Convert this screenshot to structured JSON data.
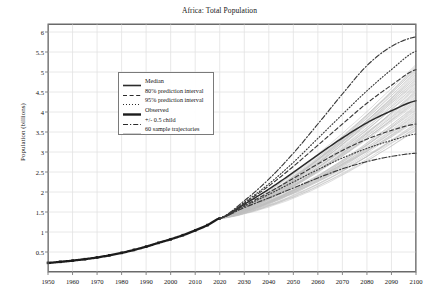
{
  "chart_data": {
    "type": "line",
    "title": "Africa: Total Population",
    "xlabel": "",
    "ylabel": "Population (billions)",
    "xlim": [
      1950,
      2100
    ],
    "ylim": [
      0,
      6.2
    ],
    "grid": true,
    "legend_position": "upper left inside",
    "xticks": [
      1950,
      1960,
      1970,
      1980,
      1990,
      2000,
      2010,
      2020,
      2030,
      2040,
      2050,
      2060,
      2070,
      2080,
      2090,
      2100
    ],
    "yticks": [
      0.5,
      1,
      1.5,
      2,
      2.5,
      3,
      3.5,
      4,
      4.5,
      5,
      5.5,
      6
    ],
    "legend": [
      {
        "label": "Median",
        "style": "solid",
        "width": 1.6,
        "color": "#2b2b2b"
      },
      {
        "label": "80% prediction interval",
        "style": "dashed",
        "width": 1.2,
        "color": "#2b2b2b"
      },
      {
        "label": "95% prediction interval",
        "style": "dotted",
        "width": 1.2,
        "color": "#2b2b2b"
      },
      {
        "label": "Observed",
        "style": "solid-thick",
        "width": 2.4,
        "color": "#1c1c1c"
      },
      {
        "label": "+/- 0.5 child",
        "style": "dashdot",
        "width": 1.2,
        "color": "#2b2b2b"
      },
      {
        "label": "60 sample trajectories",
        "style": "thin-solid",
        "width": 0.7,
        "color": "#b9b9b9"
      }
    ],
    "series": [
      {
        "name": "Observed",
        "style": "solid-thick",
        "markers": "square",
        "x": [
          1950,
          1955,
          1960,
          1965,
          1970,
          1975,
          1980,
          1985,
          1990,
          1995,
          2000,
          2005,
          2010,
          2015,
          2020
        ],
        "values": [
          0.228,
          0.254,
          0.284,
          0.32,
          0.363,
          0.416,
          0.478,
          0.551,
          0.634,
          0.728,
          0.818,
          0.92,
          1.039,
          1.172,
          1.341
        ]
      },
      {
        "name": "Median",
        "style": "solid",
        "x": [
          2020,
          2030,
          2040,
          2050,
          2060,
          2070,
          2080,
          2090,
          2100
        ],
        "values": [
          1.341,
          1.69,
          2.07,
          2.49,
          2.93,
          3.35,
          3.73,
          4.03,
          4.28
        ]
      },
      {
        "name": "80% upper",
        "style": "dashed",
        "x": [
          2020,
          2030,
          2040,
          2050,
          2060,
          2070,
          2080,
          2090,
          2100
        ],
        "values": [
          1.341,
          1.72,
          2.15,
          2.64,
          3.17,
          3.7,
          4.22,
          4.67,
          5.06
        ]
      },
      {
        "name": "80% lower",
        "style": "dashed",
        "x": [
          2020,
          2030,
          2040,
          2050,
          2060,
          2070,
          2080,
          2090,
          2100
        ],
        "values": [
          1.341,
          1.66,
          1.99,
          2.34,
          2.7,
          3.04,
          3.32,
          3.54,
          3.7
        ]
      },
      {
        "name": "95% upper",
        "style": "dotted",
        "x": [
          2020,
          2030,
          2040,
          2050,
          2060,
          2070,
          2080,
          2090,
          2100
        ],
        "values": [
          1.341,
          1.74,
          2.2,
          2.74,
          3.34,
          3.94,
          4.53,
          5.06,
          5.52
        ]
      },
      {
        "name": "95% lower",
        "style": "dotted",
        "x": [
          2020,
          2030,
          2040,
          2050,
          2060,
          2070,
          2080,
          2090,
          2100
        ],
        "values": [
          1.341,
          1.64,
          1.94,
          2.25,
          2.56,
          2.85,
          3.09,
          3.29,
          3.45
        ]
      },
      {
        "name": "+0.5 child",
        "style": "dashdot",
        "x": [
          2020,
          2030,
          2040,
          2050,
          2060,
          2070,
          2080,
          2090,
          2100
        ],
        "values": [
          1.341,
          1.78,
          2.32,
          2.97,
          3.7,
          4.45,
          5.16,
          5.64,
          5.88
        ]
      },
      {
        "name": "-0.5 child",
        "style": "dashdot",
        "x": [
          2020,
          2030,
          2040,
          2050,
          2060,
          2070,
          2080,
          2090,
          2100
        ],
        "values": [
          1.341,
          1.61,
          1.85,
          2.1,
          2.35,
          2.58,
          2.76,
          2.89,
          2.97
        ]
      }
    ],
    "sample_trajectories": {
      "count": 60,
      "start_year": 2020,
      "end_year": 2100,
      "start_value": 1.341,
      "end_value_range": [
        3.52,
        5.2
      ],
      "color": "#bdbdbd"
    },
    "colors": {
      "grid": "#e2e2e2",
      "frame": "#6b6b6b",
      "observed": "#1c1c1c",
      "median": "#2b2b2b",
      "interval": "#3a3a3a",
      "trajectory": "#bdbdbd",
      "background": "#ffffff"
    }
  }
}
